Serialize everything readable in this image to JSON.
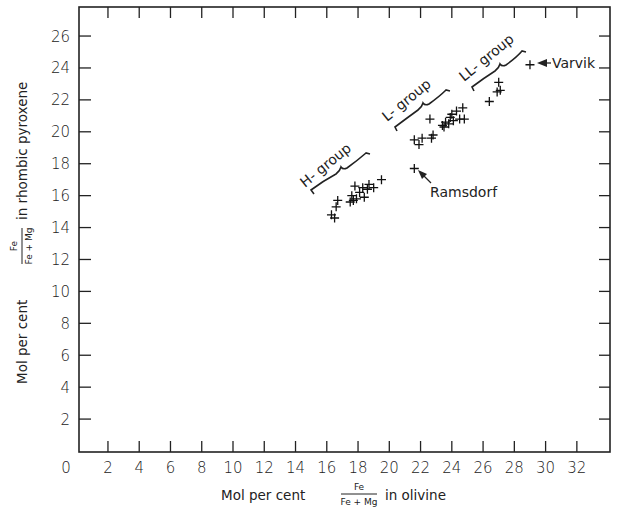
{
  "chart_data": {
    "type": "scatter",
    "title": "",
    "xlabel": "Mol per cent Fe/(Fe+Mg) in olivine",
    "ylabel": "Mol per cent Fe/(Fe+Mg) in rhombic pyroxene",
    "xlabel_parts": {
      "prefix": "Mol per cent",
      "numerator": "Fe",
      "denominator": "Fe + Mg",
      "suffix": "in olivine"
    },
    "ylabel_parts": {
      "prefix": "Mol per cent",
      "numerator": "Fe",
      "denominator": "Fe + Mg",
      "suffix": "in rhombic pyroxene"
    },
    "xlim": [
      0,
      34
    ],
    "ylim": [
      0,
      27.5
    ],
    "xticks": [
      0,
      2,
      4,
      6,
      8,
      10,
      12,
      14,
      16,
      18,
      20,
      22,
      24,
      26,
      28,
      30,
      32
    ],
    "yticks": [
      2,
      4,
      6,
      8,
      10,
      12,
      14,
      16,
      18,
      20,
      22,
      24,
      26
    ],
    "grid": false,
    "marker": "+",
    "series": [
      {
        "name": "H-group",
        "points": [
          [
            16.3,
            14.8
          ],
          [
            16.5,
            14.6
          ],
          [
            16.6,
            15.3
          ],
          [
            16.7,
            15.7
          ],
          [
            17.5,
            15.6
          ],
          [
            17.6,
            16.0
          ],
          [
            17.7,
            15.7
          ],
          [
            17.8,
            16.6
          ],
          [
            17.9,
            15.8
          ],
          [
            18.1,
            16.2
          ],
          [
            18.3,
            16.5
          ],
          [
            18.4,
            15.9
          ],
          [
            18.6,
            16.4
          ],
          [
            18.7,
            16.7
          ],
          [
            19.0,
            16.5
          ],
          [
            19.5,
            17.0
          ]
        ]
      },
      {
        "name": "L-group",
        "points": [
          [
            21.6,
            19.5
          ],
          [
            21.9,
            19.2
          ],
          [
            22.1,
            19.6
          ],
          [
            22.6,
            20.8
          ],
          [
            22.7,
            19.6
          ],
          [
            22.8,
            19.8
          ],
          [
            23.4,
            20.4
          ],
          [
            23.5,
            20.3
          ],
          [
            23.6,
            20.6
          ],
          [
            23.8,
            20.5
          ],
          [
            23.9,
            20.9
          ],
          [
            24.0,
            21.1
          ],
          [
            24.1,
            20.7
          ],
          [
            24.3,
            21.3
          ],
          [
            24.5,
            20.8
          ],
          [
            24.7,
            21.5
          ],
          [
            24.8,
            20.8
          ]
        ]
      },
      {
        "name": "LL-group",
        "points": [
          [
            26.4,
            21.9
          ],
          [
            26.9,
            22.5
          ],
          [
            27.0,
            23.1
          ],
          [
            27.1,
            22.6
          ]
        ]
      },
      {
        "name": "Ramsdorf",
        "points": [
          [
            21.6,
            17.7
          ]
        ]
      },
      {
        "name": "Varvik",
        "points": [
          [
            29.0,
            24.2
          ]
        ]
      }
    ],
    "annotations": [
      {
        "text": "H-group",
        "type": "bracket-label"
      },
      {
        "text": "L-group",
        "type": "bracket-label"
      },
      {
        "text": "LL-group",
        "type": "bracket-label"
      },
      {
        "text": "Ramsdorf",
        "type": "arrow-label"
      },
      {
        "text": "Varvik",
        "type": "arrow-label"
      }
    ]
  },
  "labels": {
    "h_group": "H- group",
    "l_group": "L- group",
    "ll_group": "LL- group",
    "ramsdorf": "Ramsdorf",
    "varvik": "Varvik"
  }
}
